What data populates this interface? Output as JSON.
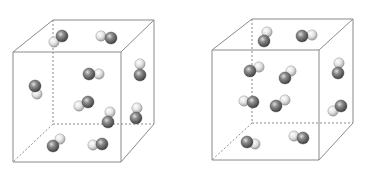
{
  "figure": {
    "colors": {
      "edge": "#8a8a8a",
      "dark_atom": "#5a5a5a",
      "dark_atom_highlight": "#d8d8d8",
      "light_atom": "#e6e6e6",
      "light_atom_highlight": "#ffffff",
      "atom_stroke": "#444444"
    },
    "cubes": [
      {
        "id": "left-cube",
        "front": {
          "x1": 13,
          "y1": 52,
          "x2": 121,
          "y2": 162
        },
        "back": {
          "x1": 53,
          "y1": 20,
          "x2": 154,
          "y2": 124
        },
        "molecules": [
          {
            "dark": [
              62,
              36
            ],
            "light": [
              54,
              42
            ]
          },
          {
            "dark": [
              111,
              38
            ],
            "light": [
              101,
              36
            ]
          },
          {
            "dark": [
              89,
              74
            ],
            "light": [
              99,
              74
            ]
          },
          {
            "dark": [
              140,
              75
            ],
            "light": [
              140,
              64
            ]
          },
          {
            "dark": [
              35,
              86
            ],
            "light": [
              37,
              94
            ]
          },
          {
            "dark": [
              88,
              102
            ],
            "light": [
              79,
              106
            ]
          },
          {
            "dark": [
              108,
              122
            ],
            "light": [
              110,
              112
            ]
          },
          {
            "dark": [
              136,
              118
            ],
            "light": [
              137,
              108
            ]
          },
          {
            "dark": [
              53,
              146
            ],
            "light": [
              60,
              139
            ]
          },
          {
            "dark": [
              102,
              144
            ],
            "light": [
              93,
              145
            ]
          }
        ]
      },
      {
        "id": "right-cube",
        "front": {
          "x1": 212,
          "y1": 50,
          "x2": 319,
          "y2": 160
        },
        "back": {
          "x1": 252,
          "y1": 19,
          "x2": 353,
          "y2": 123
        },
        "molecules": [
          {
            "dark": [
              264,
              41
            ],
            "light": [
              267,
              32
            ]
          },
          {
            "dark": [
              302,
              36
            ],
            "light": [
              312,
              35
            ]
          },
          {
            "dark": [
              250,
              71
            ],
            "light": [
              259,
              67
            ]
          },
          {
            "dark": [
              285,
              78
            ],
            "light": [
              291,
              71
            ]
          },
          {
            "dark": [
              338,
              73
            ],
            "light": [
              339,
              63
            ]
          },
          {
            "dark": [
              253,
              102
            ],
            "light": [
              244,
              101
            ]
          },
          {
            "dark": [
              276,
              106
            ],
            "light": [
              285,
              100
            ]
          },
          {
            "dark": [
              341,
              106
            ],
            "light": [
              333,
              111
            ]
          },
          {
            "dark": [
              247,
              142
            ],
            "light": [
              255,
              144
            ]
          },
          {
            "dark": [
              303,
              138
            ],
            "light": [
              294,
              136
            ]
          }
        ]
      }
    ]
  }
}
